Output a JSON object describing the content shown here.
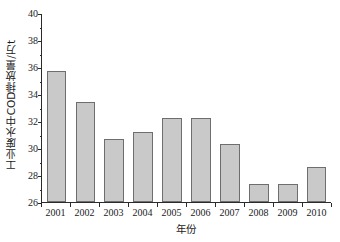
{
  "chart_data": {
    "type": "bar",
    "title": "",
    "xlabel": "年份",
    "ylabel": "工业废水中COD排放量/万t",
    "categories": [
      "2001",
      "2002",
      "2003",
      "2004",
      "2005",
      "2006",
      "2007",
      "2008",
      "2009",
      "2010"
    ],
    "values": [
      35.7,
      33.4,
      30.7,
      31.2,
      32.2,
      32.2,
      30.3,
      27.3,
      27.3,
      28.6
    ],
    "ylim": [
      26,
      40
    ],
    "xlim_categories": 10,
    "ytick_values": [
      26,
      28,
      30,
      32,
      34,
      36,
      38,
      40
    ],
    "ytick_labels": [
      "26",
      "28",
      "30",
      "32",
      "34",
      "36",
      "38",
      "40"
    ],
    "yminor_values": [
      27,
      29,
      31,
      33,
      35,
      37,
      39
    ],
    "grid": false,
    "legend": null,
    "legend_position": "none",
    "bar_color": "#c9c9c9",
    "bar_edge_color": "#6e6e6e",
    "axis_color": "#2b2b2b",
    "background_color": "#ffffff"
  }
}
